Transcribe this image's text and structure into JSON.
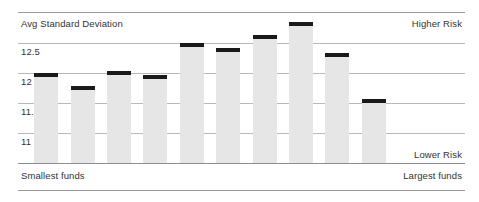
{
  "chart_data": {
    "type": "bar",
    "title": "Avg Standard Deviation",
    "xlabel": "",
    "ylabel": "Avg Standard Deviation",
    "ylim": [
      10.75,
      13.05
    ],
    "grid": true,
    "legend_position": "none",
    "yticks": [
      "12.5",
      "12",
      "11.5",
      "11"
    ],
    "ytick_values": [
      12.5,
      12,
      11.5,
      11
    ],
    "categories": [
      "1",
      "2",
      "3",
      "4",
      "5",
      "6",
      "7",
      "8",
      "9",
      "10"
    ],
    "values": [
      12.0,
      11.78,
      12.04,
      11.97,
      12.5,
      12.42,
      12.64,
      12.85,
      12.34,
      11.56
    ],
    "annotations": {
      "top_left": "Avg Standard Deviation",
      "top_right": "Higher Risk",
      "bottom_right_inside": "Lower Risk",
      "bottom_left": "Smallest funds",
      "bottom_right": "Largest funds"
    },
    "colors": {
      "bar_fill": "#e6e6e6",
      "marker": "#1a1a1a",
      "gridline": "#b9b9b9",
      "rule": "#8d8d8d",
      "text": "#333333",
      "background": "#ffffff"
    }
  },
  "axis": {
    "tick_12_5": "12.5",
    "tick_12": "12",
    "tick_11_5": "11.5",
    "tick_11": "11"
  },
  "labels": {
    "title": "Avg Standard Deviation",
    "higher_risk": "Higher Risk",
    "lower_risk": "Lower Risk",
    "smallest_funds": "Smallest funds",
    "largest_funds": "Largest funds"
  }
}
